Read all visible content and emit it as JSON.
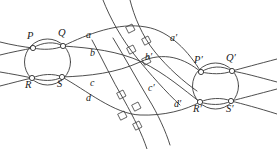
{
  "figure": {
    "type": "topological-diagram",
    "background_color": "#ffffff",
    "stroke_color": "#3a3a3a",
    "label_color": "#1a1a1a",
    "width": 277,
    "height": 149
  },
  "labels": {
    "P": "P",
    "Q": "Q",
    "R": "R",
    "S": "S",
    "Pp": "P′",
    "Qp": "Q′",
    "Rp": "R′",
    "Sp": "S′",
    "a": "a",
    "b": "b",
    "c": "c",
    "d": "d",
    "ap": "a′",
    "bp": "b′",
    "cp": "c′",
    "dp": "d′"
  },
  "label_positions": {
    "P": {
      "x": 27,
      "y": 38
    },
    "Q": {
      "x": 58,
      "y": 35
    },
    "R": {
      "x": 26,
      "y": 84
    },
    "S": {
      "x": 58,
      "y": 85
    },
    "Pp": {
      "x": 196,
      "y": 62
    },
    "Qp": {
      "x": 228,
      "y": 60
    },
    "Rp": {
      "x": 195,
      "y": 110
    },
    "Sp": {
      "x": 228,
      "y": 110
    },
    "a": {
      "x": 88,
      "y": 35
    },
    "b": {
      "x": 92,
      "y": 53
    },
    "c": {
      "x": 92,
      "y": 83
    },
    "d": {
      "x": 88,
      "y": 98
    },
    "ap": {
      "x": 172,
      "y": 38
    },
    "bp": {
      "x": 147,
      "y": 57
    },
    "cp": {
      "x": 150,
      "y": 88
    },
    "dp": {
      "x": 176,
      "y": 104
    }
  },
  "nodes": {
    "left": {
      "P": [
        33,
        48
      ],
      "Q": [
        63,
        46
      ],
      "R": [
        32,
        78
      ],
      "S": [
        62,
        77
      ]
    },
    "right": {
      "Pp": [
        201,
        72
      ],
      "Qp": [
        232,
        71
      ],
      "Rp": [
        200,
        102
      ],
      "Sp": [
        231,
        101
      ]
    }
  },
  "right_angle_marks": [
    {
      "x": 130,
      "y": 31
    },
    {
      "x": 146,
      "y": 43
    },
    {
      "x": 131,
      "y": 52
    },
    {
      "x": 146,
      "y": 63
    },
    {
      "x": 121,
      "y": 97
    },
    {
      "x": 136,
      "y": 109
    },
    {
      "x": 122,
      "y": 118
    },
    {
      "x": 137,
      "y": 128
    }
  ]
}
